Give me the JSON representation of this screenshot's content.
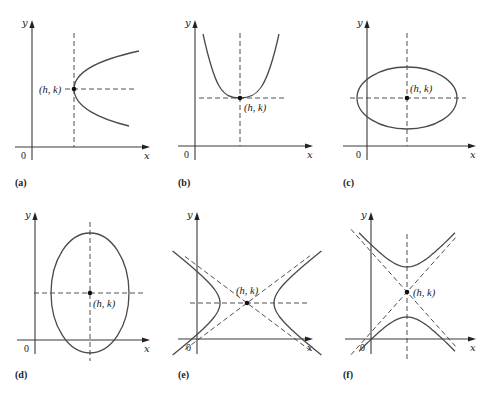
{
  "figure": {
    "colors": {
      "ink": "#3a3a3a",
      "curve": "#4a4a4a",
      "background": "#ffffff"
    },
    "axis_labels": {
      "x": "x",
      "y": "y",
      "origin": "0"
    },
    "center_label": "(h, k)",
    "panels": [
      {
        "id": "a",
        "label": "(a)",
        "type": "parabola-right",
        "origin": [
          32,
          147
        ],
        "axis_top": 20,
        "axis_right": 150,
        "axis_bottom": 160,
        "axis_left": 15,
        "center": [
          74,
          89
        ],
        "vdash": [
          33,
          147
        ],
        "hdash": [
          65,
          136
        ],
        "curve_ends": [
          [
            139,
            51
          ],
          [
            129,
            126
          ]
        ],
        "center_label_pos": [
          39,
          93
        ],
        "label_pos": [
          15,
          186
        ]
      },
      {
        "id": "b",
        "label": "(b)",
        "type": "parabola-up",
        "origin": [
          195,
          146
        ],
        "axis_top": 20,
        "axis_right": 313,
        "axis_bottom": 160,
        "axis_left": 178,
        "center": [
          240,
          98
        ],
        "vdash": [
          33,
          146
        ],
        "hdash": [
          199,
          285
        ],
        "curve_ends": [
          [
            203,
            34
          ],
          [
            279,
            34
          ]
        ],
        "center_label_pos": [
          244,
          111
        ],
        "label_pos": [
          178,
          186
        ]
      },
      {
        "id": "c",
        "label": "(c)",
        "type": "ellipse",
        "origin": [
          367,
          146
        ],
        "axis_top": 20,
        "axis_right": 476,
        "axis_bottom": 160,
        "axis_left": 343,
        "center": [
          407,
          98
        ],
        "rx": 50,
        "ry": 31,
        "vdash": [
          33,
          146
        ],
        "hdash": [
          350,
          466
        ],
        "center_label_pos": [
          410,
          92
        ],
        "label_pos": [
          343,
          186
        ]
      },
      {
        "id": "d",
        "label": "(d)",
        "type": "ellipse",
        "origin": [
          35,
          340
        ],
        "axis_top": 212,
        "axis_right": 150,
        "axis_bottom": 354,
        "axis_left": 17,
        "center": [
          90,
          293
        ],
        "rx": 39,
        "ry": 60,
        "vdash": [
          222,
          361
        ],
        "hdash": [
          34,
          144
        ],
        "center_label_pos": [
          93,
          307
        ],
        "label_pos": [
          15,
          378
        ]
      },
      {
        "id": "e",
        "label": "(e)",
        "type": "hyperbola-horizontal",
        "origin": [
          197,
          339
        ],
        "axis_top": 212,
        "axis_right": 313,
        "axis_bottom": 354,
        "axis_left": 178,
        "center": [
          247,
          303
        ],
        "a": 27,
        "slope": 0.75,
        "asymptote_span": [
          -62,
          63
        ],
        "branch_height": 52,
        "hdash": [
          190,
          309
        ],
        "center_label_pos": [
          236,
          294
        ],
        "label_pos": [
          178,
          378
        ]
      },
      {
        "id": "f",
        "label": "(f)",
        "type": "hyperbola-vertical",
        "origin": [
          371,
          339
        ],
        "axis_top": 212,
        "axis_right": 476,
        "axis_bottom": 354,
        "axis_left": 345,
        "center": [
          407,
          292
        ],
        "a": 25,
        "slope": 1.12,
        "asymptote_span": [
          -56,
          50
        ],
        "branch_width": 48,
        "vdash": [
          234,
          360
        ],
        "center_label_pos": [
          413,
          296
        ],
        "label_pos": [
          343,
          378
        ]
      }
    ]
  }
}
